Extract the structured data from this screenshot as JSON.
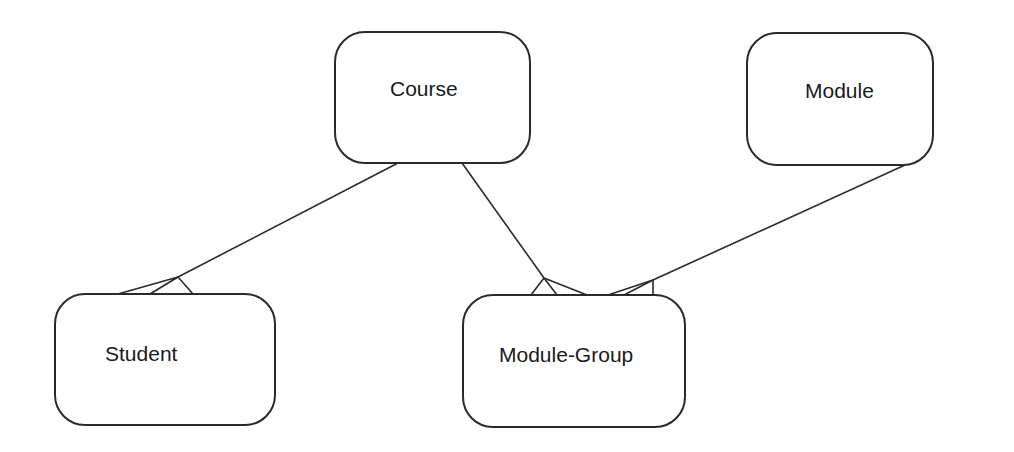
{
  "diagram": {
    "type": "entity-relationship",
    "entities": [
      {
        "id": "course",
        "label": "Course",
        "x": 335,
        "y": 32,
        "w": 195,
        "h": 131,
        "tx": 390,
        "ty": 96
      },
      {
        "id": "module",
        "label": "Module",
        "x": 747,
        "y": 33,
        "w": 186,
        "h": 132,
        "tx": 805,
        "ty": 98
      },
      {
        "id": "student",
        "label": "Student",
        "x": 55,
        "y": 294,
        "w": 220,
        "h": 131,
        "tx": 105,
        "ty": 361
      },
      {
        "id": "module-group",
        "label": "Module-Group",
        "x": 463,
        "y": 295,
        "w": 222,
        "h": 132,
        "tx": 499,
        "ty": 362
      }
    ],
    "relationships": [
      {
        "from": "course",
        "to": "student",
        "cardinality": "one-to-many"
      },
      {
        "from": "course",
        "to": "module-group",
        "cardinality": "one-to-many"
      },
      {
        "from": "module",
        "to": "module-group",
        "cardinality": "one-to-many"
      }
    ]
  }
}
